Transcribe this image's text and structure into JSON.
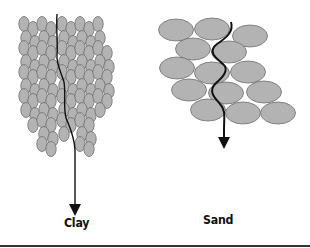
{
  "diagram": {
    "panels": [
      {
        "id": "clay",
        "label": "Clay",
        "particle_shape": "small vertical ellipses",
        "flow_path": "nearly straight downward"
      },
      {
        "id": "sand",
        "label": "Sand",
        "particle_shape": "large horizontal ellipses",
        "flow_path": "winding downward"
      }
    ],
    "colors": {
      "particle_fill": "#b3b3b3",
      "particle_stroke": "#707070",
      "arrow": "#111111",
      "rule": "#333333"
    }
  }
}
